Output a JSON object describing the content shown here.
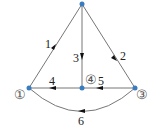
{
  "diagram": {
    "type": "directed-graph",
    "nodes": [
      {
        "id": "2",
        "label": "",
        "x": 82,
        "y": 4
      },
      {
        "id": "1",
        "label": "①",
        "x": 29,
        "y": 88
      },
      {
        "id": "4",
        "label": "④",
        "x": 82,
        "y": 88
      },
      {
        "id": "3",
        "label": "③",
        "x": 135,
        "y": 88
      }
    ],
    "edges": [
      {
        "id": "e1",
        "label": "1",
        "from": "1",
        "to": "2"
      },
      {
        "id": "e2",
        "label": "2",
        "from": "2",
        "to": "3"
      },
      {
        "id": "e3",
        "label": "3",
        "from": "2",
        "to": "4"
      },
      {
        "id": "e4",
        "label": "4",
        "from": "4",
        "to": "1"
      },
      {
        "id": "e5",
        "label": "5",
        "from": "3",
        "to": "4"
      },
      {
        "id": "e6",
        "label": "6",
        "from": "3",
        "to": "1",
        "shape": "curve-below"
      }
    ],
    "colors": {
      "edge": "#666666",
      "node": "#3a7dbf",
      "arrow": "#111111"
    }
  }
}
